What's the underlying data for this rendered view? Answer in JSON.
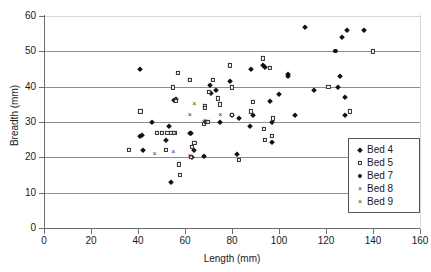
{
  "chart_data": {
    "type": "scatter",
    "title": "",
    "xlabel": "Length (mm)",
    "ylabel": "Breadth (mm)",
    "xlim": [
      0,
      160
    ],
    "ylim": [
      0,
      60
    ],
    "xticks": [
      0,
      20,
      40,
      60,
      80,
      100,
      120,
      140,
      160
    ],
    "yticks": [
      0,
      10,
      20,
      30,
      40,
      50,
      60
    ],
    "grid": "horizontal",
    "legend_position": "lower-right-inside",
    "series": [
      {
        "name": "Bed 4",
        "marker": "filled-diamond",
        "color": "#111111",
        "points": [
          [
            41,
            45
          ],
          [
            41,
            26
          ],
          [
            41.5,
            26.3
          ],
          [
            42,
            22
          ],
          [
            46,
            30
          ],
          [
            52,
            25
          ],
          [
            53,
            29
          ],
          [
            54,
            13
          ],
          [
            55.5,
            36.2
          ],
          [
            56,
            36.5
          ],
          [
            62,
            27
          ],
          [
            62.5,
            27
          ],
          [
            63,
            20
          ],
          [
            64,
            22
          ],
          [
            68,
            20.5
          ],
          [
            70.5,
            40.5
          ],
          [
            71,
            38.2
          ],
          [
            73,
            39
          ],
          [
            75,
            30
          ],
          [
            79,
            41.5
          ],
          [
            80,
            32
          ],
          [
            82,
            21
          ],
          [
            83,
            31
          ],
          [
            87.5,
            29
          ],
          [
            88,
            45
          ],
          [
            89,
            32
          ],
          [
            93,
            46
          ],
          [
            94,
            45.5
          ],
          [
            96,
            36
          ],
          [
            97,
            30
          ],
          [
            97,
            24.2
          ],
          [
            100,
            38
          ],
          [
            104,
            43.5
          ],
          [
            104,
            43
          ],
          [
            107,
            32
          ],
          [
            111,
            57
          ],
          [
            115,
            39
          ],
          [
            125,
            40
          ],
          [
            126,
            43
          ],
          [
            127,
            54
          ],
          [
            128,
            32
          ],
          [
            128,
            37
          ],
          [
            129,
            56
          ],
          [
            136,
            56
          ]
        ]
      },
      {
        "name": "Bed 5",
        "marker": "open-square",
        "color": "#2a2a2a",
        "points": [
          [
            36,
            22
          ],
          [
            41,
            33
          ],
          [
            48,
            27
          ],
          [
            50,
            27
          ],
          [
            52,
            22
          ],
          [
            52.5,
            27
          ],
          [
            54,
            27
          ],
          [
            55,
            39.8
          ],
          [
            55.5,
            27
          ],
          [
            56,
            36
          ],
          [
            57,
            44
          ],
          [
            57.5,
            18
          ],
          [
            58,
            15
          ],
          [
            62,
            42
          ],
          [
            62.5,
            20.2
          ],
          [
            63,
            23
          ],
          [
            64,
            24
          ],
          [
            68,
            29.5
          ],
          [
            68.5,
            34.5
          ],
          [
            68.5,
            34
          ],
          [
            69,
            30
          ],
          [
            69.5,
            30
          ],
          [
            70,
            38.5
          ],
          [
            72,
            42
          ],
          [
            74,
            36.7
          ],
          [
            75,
            35
          ],
          [
            79,
            46
          ],
          [
            80,
            32
          ],
          [
            80,
            39.8
          ],
          [
            83,
            19.3
          ],
          [
            88,
            33
          ],
          [
            89,
            35.8
          ],
          [
            93,
            48
          ],
          [
            93.5,
            28
          ],
          [
            94,
            25
          ],
          [
            96,
            45.2
          ],
          [
            97,
            26
          ],
          [
            97.5,
            31
          ],
          [
            121,
            40
          ],
          [
            130,
            33
          ],
          [
            140,
            50
          ]
        ]
      },
      {
        "name": "Bed 7",
        "marker": "filled-circle",
        "color": "#111111",
        "points": [
          [
            124,
            50.2
          ]
        ]
      },
      {
        "name": "Bed 8",
        "marker": "cross",
        "color": "#2a2a2a",
        "points": [
          [
            47,
            21
          ],
          [
            56,
            27
          ],
          [
            62,
            20.3
          ],
          [
            64,
            35
          ],
          [
            68,
            30
          ],
          [
            68.5,
            30.2
          ]
        ]
      },
      {
        "name": "Bed 9",
        "marker": "cross",
        "color": "#2a2a2a",
        "points": [
          [
            55,
            21.5
          ],
          [
            62,
            32
          ],
          [
            69,
            29.8
          ],
          [
            75,
            32
          ]
        ]
      }
    ]
  },
  "axes": {
    "x_title": "Length (mm)",
    "y_title": "Breadth (mm)",
    "x_tick_labels": [
      "0",
      "20",
      "40",
      "60",
      "80",
      "100",
      "120",
      "140",
      "160"
    ],
    "y_tick_labels": [
      "0",
      "10",
      "20",
      "30",
      "40",
      "50",
      "60"
    ]
  },
  "legend": {
    "entries": [
      {
        "label": "Bed 4",
        "marker": "filled-diamond"
      },
      {
        "label": "Bed 5",
        "marker": "open-square"
      },
      {
        "label": "Bed 7",
        "marker": "filled-circle"
      },
      {
        "label": "Bed 8",
        "marker": "cross"
      },
      {
        "label": "Bed 9",
        "marker": "cross"
      }
    ]
  },
  "colors": {
    "grid": "#8c8c8c",
    "axis": "#6e6e6e",
    "marker": "#111111",
    "background": "#ffffff"
  }
}
